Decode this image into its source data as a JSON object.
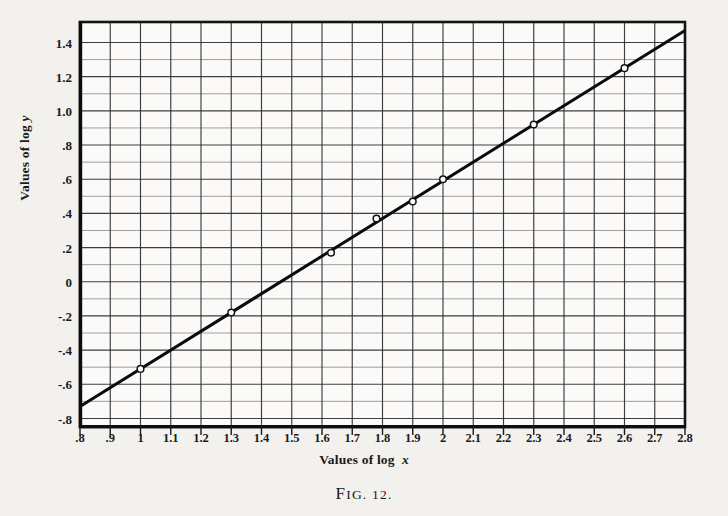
{
  "figure": {
    "caption_prefix": "F",
    "caption_rest": "IG. ",
    "caption_number": "12."
  },
  "axes": {
    "x_title_prefix": "Values of log ",
    "x_title_var": "x",
    "y_title_prefix": "Values of log ",
    "y_title_var": "y",
    "x_ticks": [
      ".8",
      ".9",
      "1",
      "1.1",
      "1.2",
      "1.3",
      "1.4",
      "1.5",
      "1.6",
      "1.7",
      "1.8",
      "1.9",
      "2",
      "2.1",
      "2.2",
      "2.3",
      "2.4",
      "2.5",
      "2.6",
      "2.7",
      "2.8"
    ],
    "y_ticks": [
      "1.4",
      "1.2",
      "1.0",
      ".8",
      ".6",
      ".4",
      ".2",
      "0",
      "-.2",
      "-.4",
      "-.6",
      "-.8"
    ]
  },
  "chart_data": {
    "type": "scatter",
    "title": "FIG. 12.",
    "xlabel": "Values of log x",
    "ylabel": "Values of log y",
    "xlim": [
      0.8,
      2.8
    ],
    "ylim": [
      -0.85,
      1.52
    ],
    "grid": true,
    "legend": "none",
    "x_tick_values": [
      0.8,
      0.9,
      1.0,
      1.1,
      1.2,
      1.3,
      1.4,
      1.5,
      1.6,
      1.7,
      1.8,
      1.9,
      2.0,
      2.1,
      2.2,
      2.3,
      2.4,
      2.5,
      2.6,
      2.7,
      2.8
    ],
    "y_tick_values": [
      1.4,
      1.2,
      1.0,
      0.8,
      0.6,
      0.4,
      0.2,
      0.0,
      -0.2,
      -0.4,
      -0.6,
      -0.8
    ],
    "y_minor_step": 0.1,
    "series": [
      {
        "name": "data points",
        "marker": "open-circle",
        "x": [
          1.0,
          1.3,
          1.63,
          1.78,
          1.9,
          2.0,
          2.3,
          2.6
        ],
        "y": [
          -0.51,
          -0.18,
          0.17,
          0.37,
          0.47,
          0.6,
          0.92,
          1.25
        ]
      },
      {
        "name": "fitted line",
        "marker": "none",
        "x": [
          0.8,
          2.8
        ],
        "y": [
          -0.73,
          1.47
        ]
      }
    ]
  },
  "colors": {
    "paper": "#f2f1ee",
    "ink": "#111111",
    "grid": "#555555",
    "frame": "#1a1a1a"
  }
}
